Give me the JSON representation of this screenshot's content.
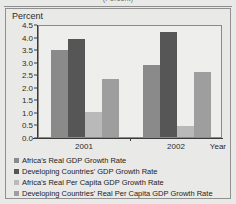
{
  "figure": {
    "top_caption": "(Percent)",
    "y_axis_title": "Percent",
    "x_axis_title": "Year"
  },
  "chart_data": {
    "type": "bar",
    "title": "(Percent)",
    "xlabel": "Year",
    "ylabel": "Percent",
    "ylim": [
      0.0,
      4.5
    ],
    "yticks": [
      "0.0",
      "0.5",
      "1.0",
      "1.5",
      "2.0",
      "2.5",
      "3.0",
      "3.5",
      "4.0",
      "4.5"
    ],
    "ytick_values": [
      0.0,
      0.5,
      1.0,
      1.5,
      2.0,
      2.5,
      3.0,
      3.5,
      4.0,
      4.5
    ],
    "grid": false,
    "legend_position": "below",
    "categories": [
      "2001",
      "2002"
    ],
    "series": [
      {
        "name": "Africa's Real GDP Growth Rate",
        "color": "#8a8a8a",
        "values": [
          3.45,
          2.85
        ]
      },
      {
        "name": "Developing Countries' GDP Growth Rate",
        "color": "#565656",
        "values": [
          3.9,
          4.2
        ]
      },
      {
        "name": "Africa's Real Per Capita GDP Growth Rate",
        "color": "#b9b9b9",
        "values": [
          1.0,
          0.45
        ]
      },
      {
        "name": "Developing Countries' Real Per Capita GDP Growth Rate",
        "color": "#9e9e9e",
        "values": [
          2.3,
          2.6
        ]
      }
    ]
  }
}
